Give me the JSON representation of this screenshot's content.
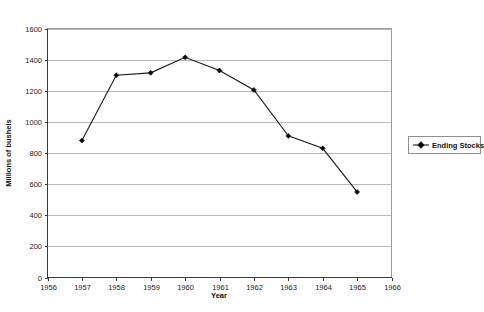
{
  "chart_data": {
    "type": "line",
    "title": "",
    "subtitle": "",
    "xlabel": "Year",
    "ylabel": "Millions of bushels",
    "xlim": [
      1956,
      1966
    ],
    "ylim": [
      0,
      1600
    ],
    "xticks": [
      1956,
      1957,
      1958,
      1959,
      1960,
      1961,
      1962,
      1963,
      1964,
      1965,
      1966
    ],
    "xtick_labels": [
      "1956",
      "1957",
      "1958",
      "1959",
      "1960",
      "1961",
      "1962",
      "1963",
      "1964",
      "1965",
      "1966"
    ],
    "yticks": [
      0,
      200,
      400,
      600,
      800,
      1000,
      1200,
      1400,
      1600
    ],
    "ytick_labels": [
      "0",
      "200",
      "400",
      "600",
      "800",
      "1000",
      "1200",
      "1400",
      "1600"
    ],
    "grid": "horizontal",
    "legend_position": "right",
    "x": [
      1957,
      1958,
      1959,
      1960,
      1961,
      1962,
      1963,
      1964,
      1965
    ],
    "series": [
      {
        "name": "Ending Stocks",
        "color": "#1a1a1a",
        "marker": "diamond",
        "values": [
          880,
          1300,
          1315,
          1415,
          1330,
          1205,
          910,
          830,
          550
        ]
      }
    ]
  },
  "legend": {
    "entries": [
      {
        "label": "Ending Stocks"
      }
    ]
  }
}
